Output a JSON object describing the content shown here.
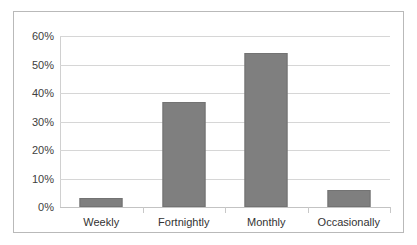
{
  "chart_data": {
    "type": "bar",
    "title": "",
    "subtitle": "",
    "xlabel": "",
    "ylabel": "",
    "categories": [
      "Weekly",
      "Fortnightly",
      "Monthly",
      "Occasionally"
    ],
    "values": [
      3,
      37,
      54,
      6
    ],
    "value_suffix": "%",
    "ylim": [
      0,
      60
    ],
    "ytick_values": [
      0,
      10,
      20,
      30,
      40,
      50,
      60
    ],
    "ytick_labels": [
      "0%",
      "10%",
      "20%",
      "30%",
      "40%",
      "50%",
      "60%"
    ],
    "grid": "horizontal",
    "legend": "none",
    "bar_color": "#7f7f7f",
    "gridline_color": "#d6d6d6",
    "border_color": "#b9b9b9"
  }
}
